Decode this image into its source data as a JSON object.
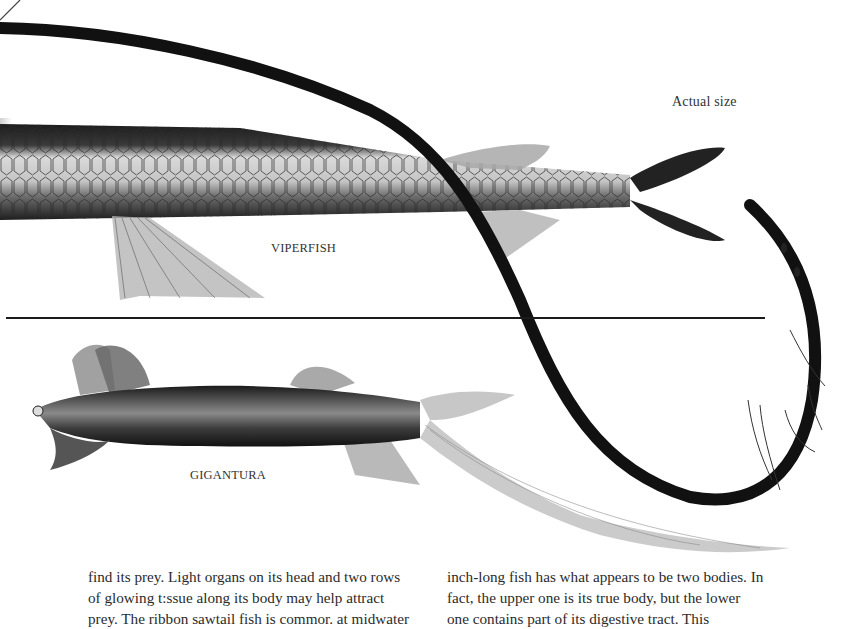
{
  "page": {
    "type": "scanned-book-page",
    "background": "#ffffff"
  },
  "labels": {
    "actual_size": "Actual size",
    "viperfish": "VIPERFISH",
    "gigantura": "GIGANTURA"
  },
  "illustrations": [
    {
      "name": "viperfish",
      "description": "Long scaled fish body with forked dark tail, drawn actual size",
      "colors": {
        "body_dark": "#1e1e1e",
        "scales_light": "#cfcfcf",
        "fins": "#9a9a9a"
      }
    },
    {
      "name": "ribbon-sawtail-fish",
      "description": "Long dark ribbon-like body sweeping across page forming loop at right",
      "colors": {
        "ribbon": "#111111"
      }
    },
    {
      "name": "gigantura",
      "description": "Dark fish with open toothed jaw, large pectoral fins and long streaming tail fin",
      "colors": {
        "body": "#3a3a3a",
        "fins": "#8c8c8c"
      }
    }
  ],
  "divider": {
    "color": "#1a1a1a"
  },
  "body_text": {
    "left_column": [
      "find its prey. Light organs on its head and two rows",
      "of glowing t:ssue along its body may help attract",
      "prey. The ribbon sawtail fish is commor. at midwater"
    ],
    "right_column": [
      "inch-long fish has what appears to be two bodies. In",
      "fact, the upper one is its true body, but the lower",
      "one contains part of its digestive tract. This"
    ]
  }
}
